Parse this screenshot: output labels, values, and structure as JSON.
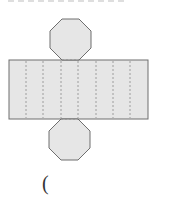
{
  "figure": {
    "colors": {
      "fill": "#e6e6e6",
      "stroke": "#6e6e6e",
      "fold_line": "#8a8a8a"
    },
    "rectangle": {
      "x": 9,
      "y": 60,
      "width": 139,
      "height": 59
    },
    "fold_lines_x": [
      26,
      43,
      61,
      78,
      96,
      113,
      130
    ],
    "top_octagon": {
      "cx": 70.5,
      "cy": 40,
      "r": 22
    },
    "bottom_octagon": {
      "cx": 70,
      "cy": 140,
      "r": 22
    }
  },
  "answer_blank": {
    "text": "("
  }
}
